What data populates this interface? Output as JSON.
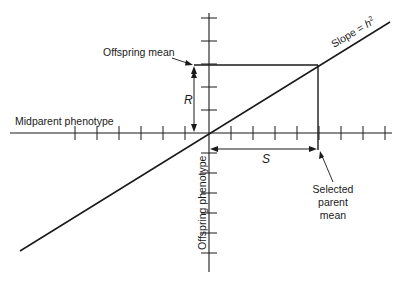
{
  "diagram": {
    "labels": {
      "x_axis": "Midparent phenotype",
      "y_axis": "Offspring phenotype",
      "offspring_mean": "Offspring mean",
      "selected_parent_line1": "Selected",
      "selected_parent_line2": "parent",
      "selected_parent_line3": "mean",
      "response": "R",
      "differential": "S",
      "slope_prefix": "Slope = ",
      "slope_var": "h",
      "slope_exp": "2"
    },
    "values": {
      "x_ticks_left": 6,
      "x_ticks_right": 8,
      "y_ticks_up": 5,
      "y_ticks_down": 7,
      "selection_differential_units": 5,
      "slope": 0.62
    }
  }
}
